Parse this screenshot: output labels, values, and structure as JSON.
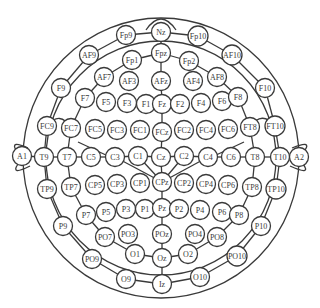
{
  "diagram": {
    "title": "",
    "type": "EEG 10-10 electrode placement",
    "stroke_color": "#3a3a3a",
    "background": "#ffffff",
    "electrodes": [
      {
        "id": "Nz",
        "label": "Nz",
        "x": 161,
        "y": 32
      },
      {
        "id": "Fp9",
        "label": "Fp9",
        "x": 126,
        "y": 35
      },
      {
        "id": "Fp10",
        "label": "Fp10",
        "x": 198,
        "y": 36
      },
      {
        "id": "Fpz",
        "label": "Fpz",
        "x": 161,
        "y": 53
      },
      {
        "id": "Fp1",
        "label": "Fp1",
        "x": 132,
        "y": 60
      },
      {
        "id": "Fp2",
        "label": "Fp2",
        "x": 189,
        "y": 61
      },
      {
        "id": "AF9",
        "label": "AF9",
        "x": 89,
        "y": 55
      },
      {
        "id": "AF10",
        "label": "AF10",
        "x": 232,
        "y": 55
      },
      {
        "id": "AF7",
        "label": "AF7",
        "x": 104,
        "y": 77
      },
      {
        "id": "AF3",
        "label": "AF3",
        "x": 129,
        "y": 81
      },
      {
        "id": "AFz",
        "label": "AFz",
        "x": 161,
        "y": 81
      },
      {
        "id": "AF4",
        "label": "AF4",
        "x": 193,
        "y": 81
      },
      {
        "id": "AF8",
        "label": "AF8",
        "x": 217,
        "y": 77
      },
      {
        "id": "F9",
        "label": "F9",
        "x": 61,
        "y": 88
      },
      {
        "id": "F10",
        "label": "F10",
        "x": 265,
        "y": 88
      },
      {
        "id": "F7",
        "label": "F7",
        "x": 85,
        "y": 98
      },
      {
        "id": "F5",
        "label": "F5",
        "x": 106,
        "y": 102
      },
      {
        "id": "F3",
        "label": "F3",
        "x": 127,
        "y": 103
      },
      {
        "id": "F1",
        "label": "F1",
        "x": 146,
        "y": 104
      },
      {
        "id": "Fz",
        "label": "Fz",
        "x": 162,
        "y": 104
      },
      {
        "id": "F2",
        "label": "F2",
        "x": 180,
        "y": 104
      },
      {
        "id": "F4",
        "label": "F4",
        "x": 201,
        "y": 103
      },
      {
        "id": "F6",
        "label": "F6",
        "x": 222,
        "y": 101
      },
      {
        "id": "F8",
        "label": "F8",
        "x": 238,
        "y": 97
      },
      {
        "id": "FC9",
        "label": "FC9",
        "x": 47,
        "y": 126
      },
      {
        "id": "FC7",
        "label": "FC7",
        "x": 71,
        "y": 128
      },
      {
        "id": "FC5",
        "label": "FC5",
        "x": 95,
        "y": 129
      },
      {
        "id": "FC3",
        "label": "FC3",
        "x": 117,
        "y": 130
      },
      {
        "id": "FC1",
        "label": "FC1",
        "x": 140,
        "y": 130
      },
      {
        "id": "FCz",
        "label": "FCz",
        "x": 162,
        "y": 132
      },
      {
        "id": "FC2",
        "label": "FC2",
        "x": 184,
        "y": 130
      },
      {
        "id": "FC4",
        "label": "FC4",
        "x": 206,
        "y": 130
      },
      {
        "id": "FC6",
        "label": "FC6",
        "x": 228,
        "y": 129
      },
      {
        "id": "FT8",
        "label": "FT8",
        "x": 250,
        "y": 127
      },
      {
        "id": "FT10",
        "label": "FT10",
        "x": 275,
        "y": 126
      },
      {
        "id": "A1",
        "label": "A1",
        "x": 22,
        "y": 156
      },
      {
        "id": "T9",
        "label": "T9",
        "x": 44,
        "y": 157
      },
      {
        "id": "T7",
        "label": "T7",
        "x": 67,
        "y": 157
      },
      {
        "id": "C5",
        "label": "C5",
        "x": 91,
        "y": 157
      },
      {
        "id": "C3",
        "label": "C3",
        "x": 115,
        "y": 157
      },
      {
        "id": "C1",
        "label": "C1",
        "x": 138,
        "y": 156
      },
      {
        "id": "Cz",
        "label": "Cz",
        "x": 161,
        "y": 157
      },
      {
        "id": "C2",
        "label": "C2",
        "x": 184,
        "y": 156
      },
      {
        "id": "C4",
        "label": "C4",
        "x": 208,
        "y": 157
      },
      {
        "id": "C6",
        "label": "C6",
        "x": 231,
        "y": 157
      },
      {
        "id": "T8",
        "label": "T8",
        "x": 255,
        "y": 157
      },
      {
        "id": "T10",
        "label": "T10",
        "x": 280,
        "y": 157
      },
      {
        "id": "A2",
        "label": "A2",
        "x": 299,
        "y": 157
      },
      {
        "id": "TP9",
        "label": "TP9",
        "x": 47,
        "y": 189
      },
      {
        "id": "TP7",
        "label": "TP7",
        "x": 71,
        "y": 187
      },
      {
        "id": "CP5",
        "label": "CP5",
        "x": 95,
        "y": 185
      },
      {
        "id": "CP3",
        "label": "CP3",
        "x": 117,
        "y": 184
      },
      {
        "id": "CP1",
        "label": "CP1",
        "x": 140,
        "y": 183
      },
      {
        "id": "CPz",
        "label": "CPz",
        "x": 162,
        "y": 182
      },
      {
        "id": "CP2",
        "label": "CP2",
        "x": 184,
        "y": 183
      },
      {
        "id": "CP4",
        "label": "CP4",
        "x": 206,
        "y": 184
      },
      {
        "id": "CP6",
        "label": "CP6",
        "x": 228,
        "y": 185
      },
      {
        "id": "TP8",
        "label": "TP8",
        "x": 252,
        "y": 187
      },
      {
        "id": "TP10",
        "label": "TP10",
        "x": 276,
        "y": 189
      },
      {
        "id": "P9",
        "label": "P9",
        "x": 63,
        "y": 226
      },
      {
        "id": "P7",
        "label": "P7",
        "x": 86,
        "y": 215
      },
      {
        "id": "P5",
        "label": "P5",
        "x": 106,
        "y": 212
      },
      {
        "id": "P3",
        "label": "P3",
        "x": 126,
        "y": 209
      },
      {
        "id": "P1",
        "label": "P1",
        "x": 145,
        "y": 209
      },
      {
        "id": "Pz",
        "label": "Pz",
        "x": 162,
        "y": 208
      },
      {
        "id": "P2",
        "label": "P2",
        "x": 179,
        "y": 209
      },
      {
        "id": "P4",
        "label": "P4",
        "x": 200,
        "y": 210
      },
      {
        "id": "P6",
        "label": "P6",
        "x": 222,
        "y": 212
      },
      {
        "id": "P8",
        "label": "P8",
        "x": 239,
        "y": 215
      },
      {
        "id": "P10",
        "label": "P10",
        "x": 261,
        "y": 226
      },
      {
        "id": "PO7",
        "label": "PO7",
        "x": 105,
        "y": 237
      },
      {
        "id": "PO3",
        "label": "PO3",
        "x": 128,
        "y": 234
      },
      {
        "id": "POz",
        "label": "POz",
        "x": 162,
        "y": 234
      },
      {
        "id": "PO4",
        "label": "PO4",
        "x": 195,
        "y": 234
      },
      {
        "id": "PO8",
        "label": "PO8",
        "x": 217,
        "y": 237
      },
      {
        "id": "PO9",
        "label": "PO9",
        "x": 92,
        "y": 259
      },
      {
        "id": "PO10",
        "label": "PO10",
        "x": 237,
        "y": 256
      },
      {
        "id": "O1",
        "label": "O1",
        "x": 135,
        "y": 254
      },
      {
        "id": "Oz",
        "label": "Oz",
        "x": 162,
        "y": 258
      },
      {
        "id": "O2",
        "label": "O2",
        "x": 188,
        "y": 254
      },
      {
        "id": "O9",
        "label": "O9",
        "x": 126,
        "y": 279
      },
      {
        "id": "Iz",
        "label": "Iz",
        "x": 162,
        "y": 284
      },
      {
        "id": "O10",
        "label": "O10",
        "x": 200,
        "y": 277
      }
    ],
    "connections": [
      [
        "Fp9",
        "Nz"
      ],
      [
        "Nz",
        "Fp10"
      ],
      [
        "Nz",
        "Fpz"
      ],
      [
        "Fpz",
        "Fp1"
      ],
      [
        "Fpz",
        "Fp2"
      ],
      [
        "Fpz",
        "AFz"
      ],
      [
        "AFz",
        "Fz"
      ],
      [
        "Fz",
        "FCz"
      ],
      [
        "FCz",
        "Cz"
      ],
      [
        "Cz",
        "CPz"
      ],
      [
        "CPz",
        "Pz"
      ],
      [
        "Pz",
        "POz"
      ],
      [
        "POz",
        "Oz"
      ],
      [
        "Oz",
        "Iz"
      ],
      [
        "Fp9",
        "AF9"
      ],
      [
        "Fp10",
        "AF10"
      ],
      [
        "AF9",
        "F9"
      ],
      [
        "AF10",
        "F10"
      ],
      [
        "F9",
        "FC9"
      ],
      [
        "F10",
        "FT10"
      ],
      [
        "FC9",
        "T9"
      ],
      [
        "FT10",
        "T10"
      ],
      [
        "T9",
        "TP9"
      ],
      [
        "T10",
        "TP10"
      ],
      [
        "TP9",
        "P9"
      ],
      [
        "TP10",
        "P10"
      ],
      [
        "P9",
        "PO9"
      ],
      [
        "P10",
        "PO10"
      ],
      [
        "PO9",
        "O9"
      ],
      [
        "PO10",
        "O10"
      ],
      [
        "O9",
        "Iz"
      ],
      [
        "O10",
        "Iz"
      ],
      [
        "Fp1",
        "AF7"
      ],
      [
        "Fp2",
        "AF8"
      ],
      [
        "AF7",
        "F7"
      ],
      [
        "AF8",
        "F8"
      ],
      [
        "F7",
        "FC7"
      ],
      [
        "F8",
        "FT8"
      ],
      [
        "FC7",
        "T7"
      ],
      [
        "FT8",
        "T8"
      ],
      [
        "T7",
        "TP7"
      ],
      [
        "T8",
        "TP8"
      ],
      [
        "TP7",
        "P7"
      ],
      [
        "TP8",
        "P8"
      ],
      [
        "P7",
        "PO7"
      ],
      [
        "P8",
        "PO8"
      ],
      [
        "PO7",
        "O1"
      ],
      [
        "PO8",
        "O2"
      ],
      [
        "O1",
        "Oz"
      ],
      [
        "O2",
        "Oz"
      ],
      [
        "A1",
        "T9"
      ],
      [
        "T9",
        "T7"
      ],
      [
        "T7",
        "C5"
      ],
      [
        "C5",
        "C3"
      ],
      [
        "C3",
        "C1"
      ],
      [
        "C1",
        "Cz"
      ],
      [
        "Cz",
        "C2"
      ],
      [
        "C2",
        "C4"
      ],
      [
        "C4",
        "C6"
      ],
      [
        "C6",
        "T8"
      ],
      [
        "T8",
        "T10"
      ],
      [
        "T10",
        "A2"
      ],
      [
        "C3",
        "CPz"
      ],
      [
        "C4",
        "CPz"
      ],
      [
        "C1",
        "CPz"
      ],
      [
        "C2",
        "CPz"
      ]
    ]
  }
}
